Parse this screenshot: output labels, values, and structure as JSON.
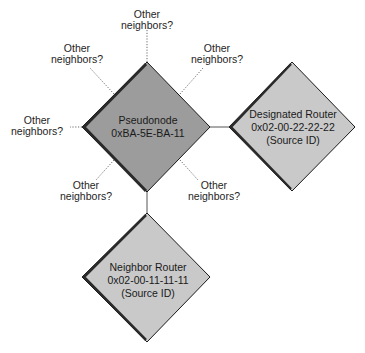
{
  "diagram": {
    "type": "network-topology",
    "nodes": {
      "pseudonode": {
        "line1": "Pseudonode",
        "line2": "0xBA-5E-BA-11",
        "fill": "#9c9c9c"
      },
      "designated_router": {
        "line1": "Designated Router",
        "line2": "0x02-00-22-22-22",
        "line3": "(Source ID)",
        "fill": "#c9c9c9"
      },
      "neighbor_router": {
        "line1": "Neighbor Router",
        "line2": "0x02-00-11-11-11",
        "line3": "(Source ID)",
        "fill": "#c9c9c9"
      }
    },
    "other_neighbors": [
      {
        "position": "top",
        "line1": "Other",
        "line2": "neighbors?"
      },
      {
        "position": "top-left",
        "line1": "Other",
        "line2": "neighbors?"
      },
      {
        "position": "top-right",
        "line1": "Other",
        "line2": "neighbors?"
      },
      {
        "position": "left",
        "line1": "Other",
        "line2": "neighbors?"
      },
      {
        "position": "bottom-left",
        "line1": "Other",
        "line2": "neighbors?"
      },
      {
        "position": "bottom-right",
        "line1": "Other",
        "line2": "neighbors?"
      }
    ],
    "edges": [
      {
        "from": "pseudonode",
        "to": "designated_router",
        "style": "solid"
      },
      {
        "from": "pseudonode",
        "to": "neighbor_router",
        "style": "solid"
      }
    ]
  }
}
